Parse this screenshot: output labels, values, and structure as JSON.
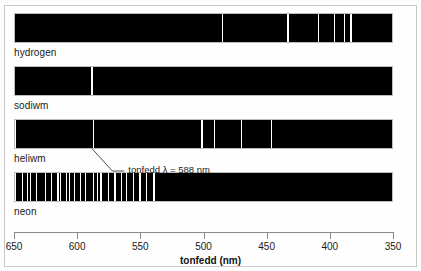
{
  "axis": {
    "title": "tonfedd (nm)",
    "ticks": [
      650,
      600,
      550,
      500,
      450,
      400,
      350
    ],
    "tick_labels": [
      "650",
      "600",
      "550",
      "500",
      "450",
      "400",
      "350"
    ],
    "wavelength_min": 350,
    "wavelength_max": 650,
    "direction": "reversed",
    "unit": "nm"
  },
  "annotation": {
    "text": "tonfedd λ = 588 nm",
    "points_to_wavelength": 588,
    "points_to_spectrum": "heliwm"
  },
  "chart_data": {
    "type": "line",
    "title": "",
    "xlabel": "tonfedd (nm)",
    "ylabel": "",
    "xlim": [
      650,
      350
    ],
    "grid": false,
    "legend": "none",
    "note": "Emission line spectra: white vertical lines on black background, x axis is wavelength in nm running right-to-left from 650 to 350",
    "series": [
      {
        "name": "hydrogen",
        "label": "hydrogen",
        "lines_nm": [
          656,
          486,
          434,
          410,
          397,
          389,
          384
        ]
      },
      {
        "name": "sodiwm",
        "label": "sodiwm",
        "lines_nm": [
          589.6,
          589.0
        ]
      },
      {
        "name": "heliwm",
        "label": "heliwm",
        "lines_nm": [
          650,
          588,
          502,
          492,
          471,
          447
        ]
      },
      {
        "name": "neon",
        "label": "neon",
        "lines_nm": [
          650,
          644,
          640,
          638,
          633,
          626,
          621,
          616,
          614,
          609,
          607,
          603,
          598,
          594,
          588,
          585,
          582,
          576,
          571,
          566,
          562,
          556,
          551,
          546,
          540
        ]
      }
    ]
  },
  "spectra": [
    {
      "id": "hydrogen",
      "label": "hydrogen"
    },
    {
      "id": "sodiwm",
      "label": "sodiwm"
    },
    {
      "id": "heliwm",
      "label": "heliwm"
    },
    {
      "id": "neon",
      "label": "neon"
    }
  ],
  "colors": {
    "spectrum_background": "#000000",
    "spectral_line": "#ffffff",
    "axis": "#8a8a8a",
    "text": "#1a1a1a",
    "frame": "#c9c9c9",
    "page_background": "#ffffff"
  }
}
